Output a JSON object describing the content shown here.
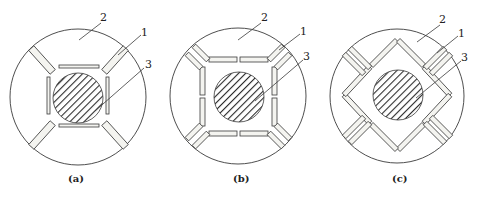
{
  "figure": {
    "panels": [
      {
        "id": "a",
        "caption": "(a)",
        "labels": {
          "l1": "1",
          "l2": "2",
          "l3": "3"
        }
      },
      {
        "id": "b",
        "caption": "(b)",
        "labels": {
          "l1": "1",
          "l2": "2",
          "l3": "3"
        }
      },
      {
        "id": "c",
        "caption": "(c)",
        "labels": {
          "l1": "1",
          "l2": "2",
          "l3": "3"
        }
      }
    ]
  },
  "colors": {
    "line": "#3a3a3a",
    "hatch": "#2a2a2a",
    "bar_fill": "#f4f4f0",
    "background": "#ffffff"
  }
}
